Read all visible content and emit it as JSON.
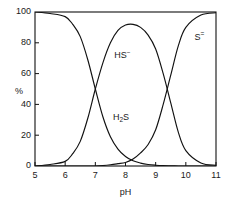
{
  "chart_data": {
    "type": "line",
    "title": "",
    "xlabel": "pH",
    "ylabel": "%",
    "xlim": [
      5,
      11
    ],
    "ylim": [
      0,
      100
    ],
    "grid": false,
    "legend_position": "inline-annotations",
    "xticks": [
      "5",
      "6",
      "7",
      "8",
      "9",
      "10",
      "11"
    ],
    "yticks": [
      "0",
      "20",
      "40",
      "60",
      "80",
      "100"
    ],
    "x": [
      5.0,
      5.5,
      6.0,
      6.25,
      6.5,
      6.75,
      7.0,
      7.25,
      7.5,
      7.75,
      8.0,
      8.25,
      8.5,
      8.75,
      9.0,
      9.25,
      9.5,
      9.75,
      10.0,
      10.5,
      11.0
    ],
    "series": [
      {
        "name": "H2S",
        "label": "H",
        "label_sub": "2",
        "label_tail": "S",
        "values": [
          100,
          99,
          97,
          92,
          84,
          69,
          50,
          32,
          19,
          11,
          6.2,
          3.4,
          1.9,
          1.0,
          0.5,
          0.2,
          0.1,
          0.02,
          0,
          0,
          0
        ]
      },
      {
        "name": "HS-",
        "label": "HS",
        "label_sup": "−",
        "values": [
          0,
          1,
          3,
          8,
          16,
          31,
          50,
          67,
          80,
          88,
          91.5,
          92,
          90,
          85,
          76,
          60,
          41,
          22,
          10,
          2,
          0.5
        ]
      },
      {
        "name": "S2-",
        "label": "S",
        "label_sup": "=",
        "values": [
          0,
          0,
          0,
          0,
          0,
          0,
          0,
          0.3,
          0.8,
          1.5,
          2.3,
          4.5,
          8.5,
          14,
          23.5,
          40,
          59,
          78,
          90,
          98,
          99.5
        ]
      }
    ],
    "annotations": [
      {
        "text": "HS",
        "superscript": "−",
        "x_data": 7.9,
        "y_data": 70,
        "name": "hs-minus-curve-label"
      },
      {
        "text": "H",
        "subscript": "2",
        "text_tail": "S",
        "x_data": 7.85,
        "y_data": 30,
        "name": "h2s-curve-label"
      },
      {
        "text": "S",
        "superscript": "=",
        "x_data": 10.45,
        "y_data": 82,
        "name": "s-2-minus-curve-label"
      }
    ],
    "crossovers": [
      {
        "x_data": 7.0,
        "y_data": 50,
        "between": [
          "H2S",
          "HS-"
        ]
      },
      {
        "x_data": 9.5,
        "y_data": 41,
        "between": [
          "HS-",
          "S2-"
        ]
      },
      {
        "x_data": 8.6,
        "y_data": 2.0,
        "between": [
          "H2S",
          "S2-"
        ]
      }
    ],
    "colors": {
      "axis": "#111111",
      "curve": "#111111",
      "background": "#ffffff",
      "text": "#1a1a1a"
    }
  }
}
